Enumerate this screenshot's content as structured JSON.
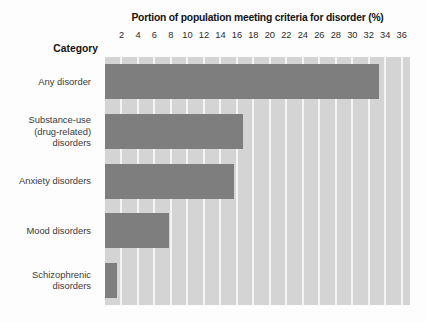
{
  "chart_data": {
    "type": "bar",
    "orientation": "horizontal",
    "title": "Portion of population meeting criteria for disorder (%)",
    "xlabel": "",
    "ylabel": "Category",
    "categories": [
      "Any disorder",
      "Substance-use (drug-related) disorders",
      "Anxiety disorders",
      "Mood disorders",
      "Schizophrenic disorders"
    ],
    "category_lines": [
      [
        "Any disorder"
      ],
      [
        "Substance-use",
        "(drug-related)",
        "disorders"
      ],
      [
        "Anxiety disorders"
      ],
      [
        "Mood disorders"
      ],
      [
        "Schizophrenic",
        "disorders"
      ]
    ],
    "values": [
      33.2,
      16.7,
      15.7,
      7.8,
      1.5
    ],
    "xlim": [
      0,
      37
    ],
    "xticks": [
      2,
      4,
      6,
      8,
      10,
      12,
      14,
      16,
      18,
      20,
      22,
      24,
      26,
      28,
      30,
      32,
      34,
      36
    ],
    "xtick_labels": [
      "2",
      "4",
      "6",
      "8",
      "10",
      "12",
      "14",
      "16",
      "18",
      "20",
      "22",
      "24",
      "26",
      "28",
      "30",
      "32",
      "34",
      "36"
    ],
    "grid": true,
    "grid_axis": "x",
    "legend": false,
    "colors": {
      "bar": "#7e7e7e",
      "plot_background": "#d4d4d4",
      "gridline": "#f4f4f4",
      "figure_background": "#fdfdfd",
      "text": "#3a3a3a",
      "heading_text": "#131313"
    }
  }
}
